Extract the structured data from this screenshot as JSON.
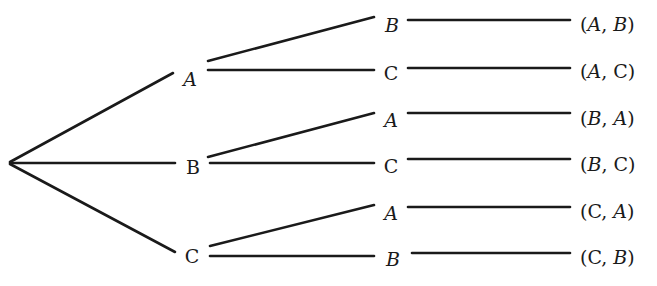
{
  "diagram": {
    "type": "tree",
    "root": {
      "x": 8,
      "y": 163
    },
    "level1": [
      {
        "label": "A",
        "x": 190,
        "y": 79,
        "italic": true
      },
      {
        "label": "B",
        "x": 193,
        "y": 167,
        "italic": false
      },
      {
        "label": "C",
        "x": 192,
        "y": 256,
        "italic": false
      }
    ],
    "level2": [
      {
        "parent": 0,
        "label": "B",
        "x": 392,
        "y": 25,
        "italic": true
      },
      {
        "parent": 0,
        "label": "C",
        "x": 391,
        "y": 73,
        "italic": false
      },
      {
        "parent": 1,
        "label": "A",
        "x": 391,
        "y": 120,
        "italic": true
      },
      {
        "parent": 1,
        "label": "C",
        "x": 391,
        "y": 166,
        "italic": false
      },
      {
        "parent": 2,
        "label": "A",
        "x": 391,
        "y": 213,
        "italic": true
      },
      {
        "parent": 2,
        "label": "B",
        "x": 393,
        "y": 259,
        "italic": true
      }
    ],
    "outcomes": [
      {
        "first": "A",
        "second": "B",
        "text": "(A, B)",
        "x": 580,
        "y": 24
      },
      {
        "first": "A",
        "second": "C",
        "text": "(A, C)",
        "x": 580,
        "y": 71
      },
      {
        "first": "B",
        "second": "A",
        "text": "(B, A)",
        "x": 580,
        "y": 118
      },
      {
        "first": "B",
        "second": "C",
        "text": "(B, C)",
        "x": 580,
        "y": 164
      },
      {
        "first": "C",
        "second": "A",
        "text": "(C, A)",
        "x": 580,
        "y": 211
      },
      {
        "first": "C",
        "second": "B",
        "text": "(C, B)",
        "x": 580,
        "y": 257
      }
    ]
  },
  "edges": {
    "root_to_level1": [
      {
        "x1": 10,
        "y1": 162,
        "x2": 173,
        "y2": 73
      },
      {
        "x1": 10,
        "y1": 163,
        "x2": 175,
        "y2": 163
      },
      {
        "x1": 10,
        "y1": 164,
        "x2": 175,
        "y2": 252
      }
    ],
    "level1_to_level2": [
      {
        "x1": 208,
        "y1": 61,
        "x2": 374,
        "y2": 17
      },
      {
        "x1": 208,
        "y1": 70,
        "x2": 374,
        "y2": 70
      },
      {
        "x1": 208,
        "y1": 157,
        "x2": 374,
        "y2": 113
      },
      {
        "x1": 210,
        "y1": 163,
        "x2": 374,
        "y2": 163
      },
      {
        "x1": 210,
        "y1": 246,
        "x2": 374,
        "y2": 205
      },
      {
        "x1": 210,
        "y1": 256,
        "x2": 374,
        "y2": 256
      }
    ],
    "level2_to_outcome": [
      {
        "x1": 408,
        "y1": 20,
        "x2": 570,
        "y2": 20
      },
      {
        "x1": 408,
        "y1": 68,
        "x2": 570,
        "y2": 68
      },
      {
        "x1": 408,
        "y1": 113,
        "x2": 570,
        "y2": 113
      },
      {
        "x1": 408,
        "y1": 159,
        "x2": 570,
        "y2": 159
      },
      {
        "x1": 408,
        "y1": 207,
        "x2": 570,
        "y2": 207
      },
      {
        "x1": 412,
        "y1": 253,
        "x2": 570,
        "y2": 253
      }
    ]
  }
}
